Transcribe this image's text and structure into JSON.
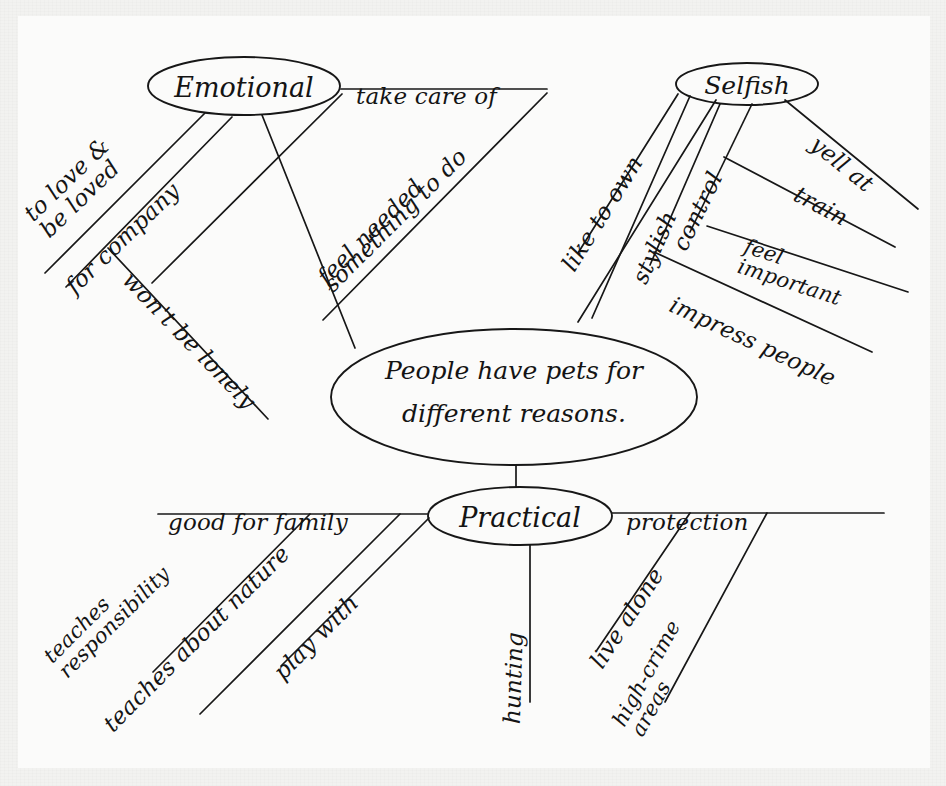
{
  "document": {
    "kind": "hand-drawn-mind-map",
    "medium": "pen on paper",
    "ink_color": "#171717",
    "paper_color": "#fbfbfa",
    "margin_color": "#f2f2f0"
  },
  "center": {
    "line1": "People have pets for",
    "line2": "different reasons."
  },
  "nodes": {
    "emotional": "Emotional",
    "selfish": "Selfish",
    "practical": "Practical"
  },
  "branches": {
    "emotional": [
      {
        "id": "to-love",
        "line1": "to love &",
        "line2": "be loved"
      },
      {
        "id": "for-company",
        "label": "for company"
      },
      {
        "id": "wont-be-lonely",
        "label": "won't be lonely"
      },
      {
        "id": "take-care-of",
        "label": "take care of"
      },
      {
        "id": "feel-needed",
        "label": "feel needed"
      },
      {
        "id": "something-to-do",
        "label": "something to do"
      }
    ],
    "selfish": [
      {
        "id": "like-to-own",
        "label": "like to own"
      },
      {
        "id": "stylish",
        "label": "stylish"
      },
      {
        "id": "control",
        "label": "control"
      },
      {
        "id": "yell-at",
        "label": "yell at"
      },
      {
        "id": "train",
        "label": "train"
      },
      {
        "id": "feel-important",
        "line1": "feel",
        "line2": "important"
      },
      {
        "id": "impress-people",
        "label": "impress people"
      }
    ],
    "practical": [
      {
        "id": "good-for-family",
        "label": "good for family"
      },
      {
        "id": "teaches-responsibility",
        "line1": "teaches",
        "line2": "responsibility"
      },
      {
        "id": "teaches-about-nature",
        "label": "teaches about nature"
      },
      {
        "id": "play-with",
        "label": "play with"
      },
      {
        "id": "hunting",
        "label": "hunting"
      },
      {
        "id": "protection",
        "label": "protection"
      },
      {
        "id": "live-alone",
        "label": "live alone"
      },
      {
        "id": "high-crime",
        "line1": "high-crime",
        "line2": "areas"
      }
    ]
  }
}
